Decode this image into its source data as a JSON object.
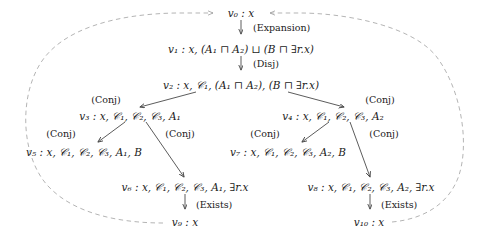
{
  "figure": {
    "type": "derivation-tree",
    "enclosure": {
      "shape": "ellipse",
      "style": "dashed",
      "color": "#999999",
      "note": "dashed ellipse loops from v9 and v10 back to v0"
    },
    "colors": {
      "text": "#1a1a1a",
      "arrow": "#555555",
      "dashed": "#a0a0a0",
      "background": "#ffffff"
    }
  },
  "nodes": [
    {
      "id": "v0",
      "label": "v₀ : x",
      "x": 241,
      "y": 13
    },
    {
      "id": "v1",
      "label": "v₁ : x, (A₁ ⊓ A₂) ⊔ (B ⊓ ∃r.x)",
      "x": 241,
      "y": 49
    },
    {
      "id": "v2",
      "label": "v₂ : x, 𝒞₁, (A₁ ⊓ A₂), (B ⊓ ∃r.x)",
      "x": 241,
      "y": 85
    },
    {
      "id": "v3",
      "label": "v₃ : x, 𝒞₁, 𝒞₂, 𝒞₃, A₁",
      "x": 130,
      "y": 116
    },
    {
      "id": "v4",
      "label": "v₄ : x, 𝒞₁, 𝒞₂, 𝒞₃, A₂",
      "x": 333,
      "y": 116
    },
    {
      "id": "v5",
      "label": "v₅ : x, 𝒞₁, 𝒞₂, 𝒞₃, A₁, B",
      "x": 84,
      "y": 152
    },
    {
      "id": "v7",
      "label": "v₇ : x, 𝒞₁, 𝒞₂, 𝒞₃, A₂, B",
      "x": 288,
      "y": 152
    },
    {
      "id": "v6",
      "label": "v₆ : x, 𝒞₁, 𝒞₂, 𝒞₃, A₁, ∃r.x",
      "x": 185,
      "y": 187
    },
    {
      "id": "v8",
      "label": "v₈ : x, 𝒞₁, 𝒞₂, 𝒞₃, A₂, ∃r.x",
      "x": 371,
      "y": 187
    },
    {
      "id": "v9",
      "label": "v₉ : x",
      "x": 185,
      "y": 222
    },
    {
      "id": "v10",
      "label": "v₁₀ : x",
      "x": 369,
      "y": 222
    }
  ],
  "rule_labels": [
    {
      "id": "expansion-top",
      "text": "(Expansion)",
      "x": 253,
      "y": 28,
      "align": "left"
    },
    {
      "id": "disj",
      "text": "(Disj)",
      "x": 253,
      "y": 64,
      "align": "left"
    },
    {
      "id": "conj-v2-left",
      "text": "(Conj)",
      "x": 106,
      "y": 100,
      "align": "center"
    },
    {
      "id": "conj-v2-right",
      "text": "(Conj)",
      "x": 380,
      "y": 100,
      "align": "center"
    },
    {
      "id": "conj-v3-left",
      "text": "(Conj)",
      "x": 61,
      "y": 134,
      "align": "center"
    },
    {
      "id": "conj-v3-right",
      "text": "(Conj)",
      "x": 180,
      "y": 134,
      "align": "center"
    },
    {
      "id": "conj-v4-left",
      "text": "(Conj)",
      "x": 265,
      "y": 134,
      "align": "center"
    },
    {
      "id": "conj-v4-right",
      "text": "(Conj)",
      "x": 384,
      "y": 134,
      "align": "center"
    },
    {
      "id": "exists-left",
      "text": "(Exists)",
      "x": 196,
      "y": 205,
      "align": "left"
    },
    {
      "id": "exists-right",
      "text": "(Exists)",
      "x": 381,
      "y": 205,
      "align": "left"
    }
  ],
  "edges": [
    {
      "id": "e-v0-v1",
      "from": "v0",
      "to": "v1",
      "kind": "vertical",
      "rule": "(Expansion)"
    },
    {
      "id": "e-v1-v2",
      "from": "v1",
      "to": "v2",
      "kind": "vertical",
      "rule": "(Disj)"
    },
    {
      "id": "e-v2-v3",
      "from": "v2",
      "to": "v3",
      "kind": "diagonal",
      "rule": "(Conj)"
    },
    {
      "id": "e-v2-v4",
      "from": "v2",
      "to": "v4",
      "kind": "diagonal",
      "rule": "(Conj)"
    },
    {
      "id": "e-v3-v5",
      "from": "v3",
      "to": "v5",
      "kind": "diagonal",
      "rule": "(Conj)"
    },
    {
      "id": "e-v3-v6",
      "from": "v3",
      "to": "v6",
      "kind": "diagonal",
      "rule": "(Conj)"
    },
    {
      "id": "e-v4-v7",
      "from": "v4",
      "to": "v7",
      "kind": "diagonal",
      "rule": "(Conj)"
    },
    {
      "id": "e-v4-v8",
      "from": "v4",
      "to": "v8",
      "kind": "diagonal",
      "rule": "(Conj)"
    },
    {
      "id": "e-v6-v9",
      "from": "v6",
      "to": "v9",
      "kind": "vertical",
      "rule": "(Exists)"
    },
    {
      "id": "e-v8-v10",
      "from": "v8",
      "to": "v10",
      "kind": "vertical",
      "rule": "(Exists)"
    },
    {
      "id": "e-v9-v0",
      "from": "v9",
      "to": "v0",
      "kind": "dashed-loop-left",
      "rule": ""
    },
    {
      "id": "e-v10-v0",
      "from": "v10",
      "to": "v0",
      "kind": "dashed-loop-right",
      "rule": ""
    }
  ]
}
